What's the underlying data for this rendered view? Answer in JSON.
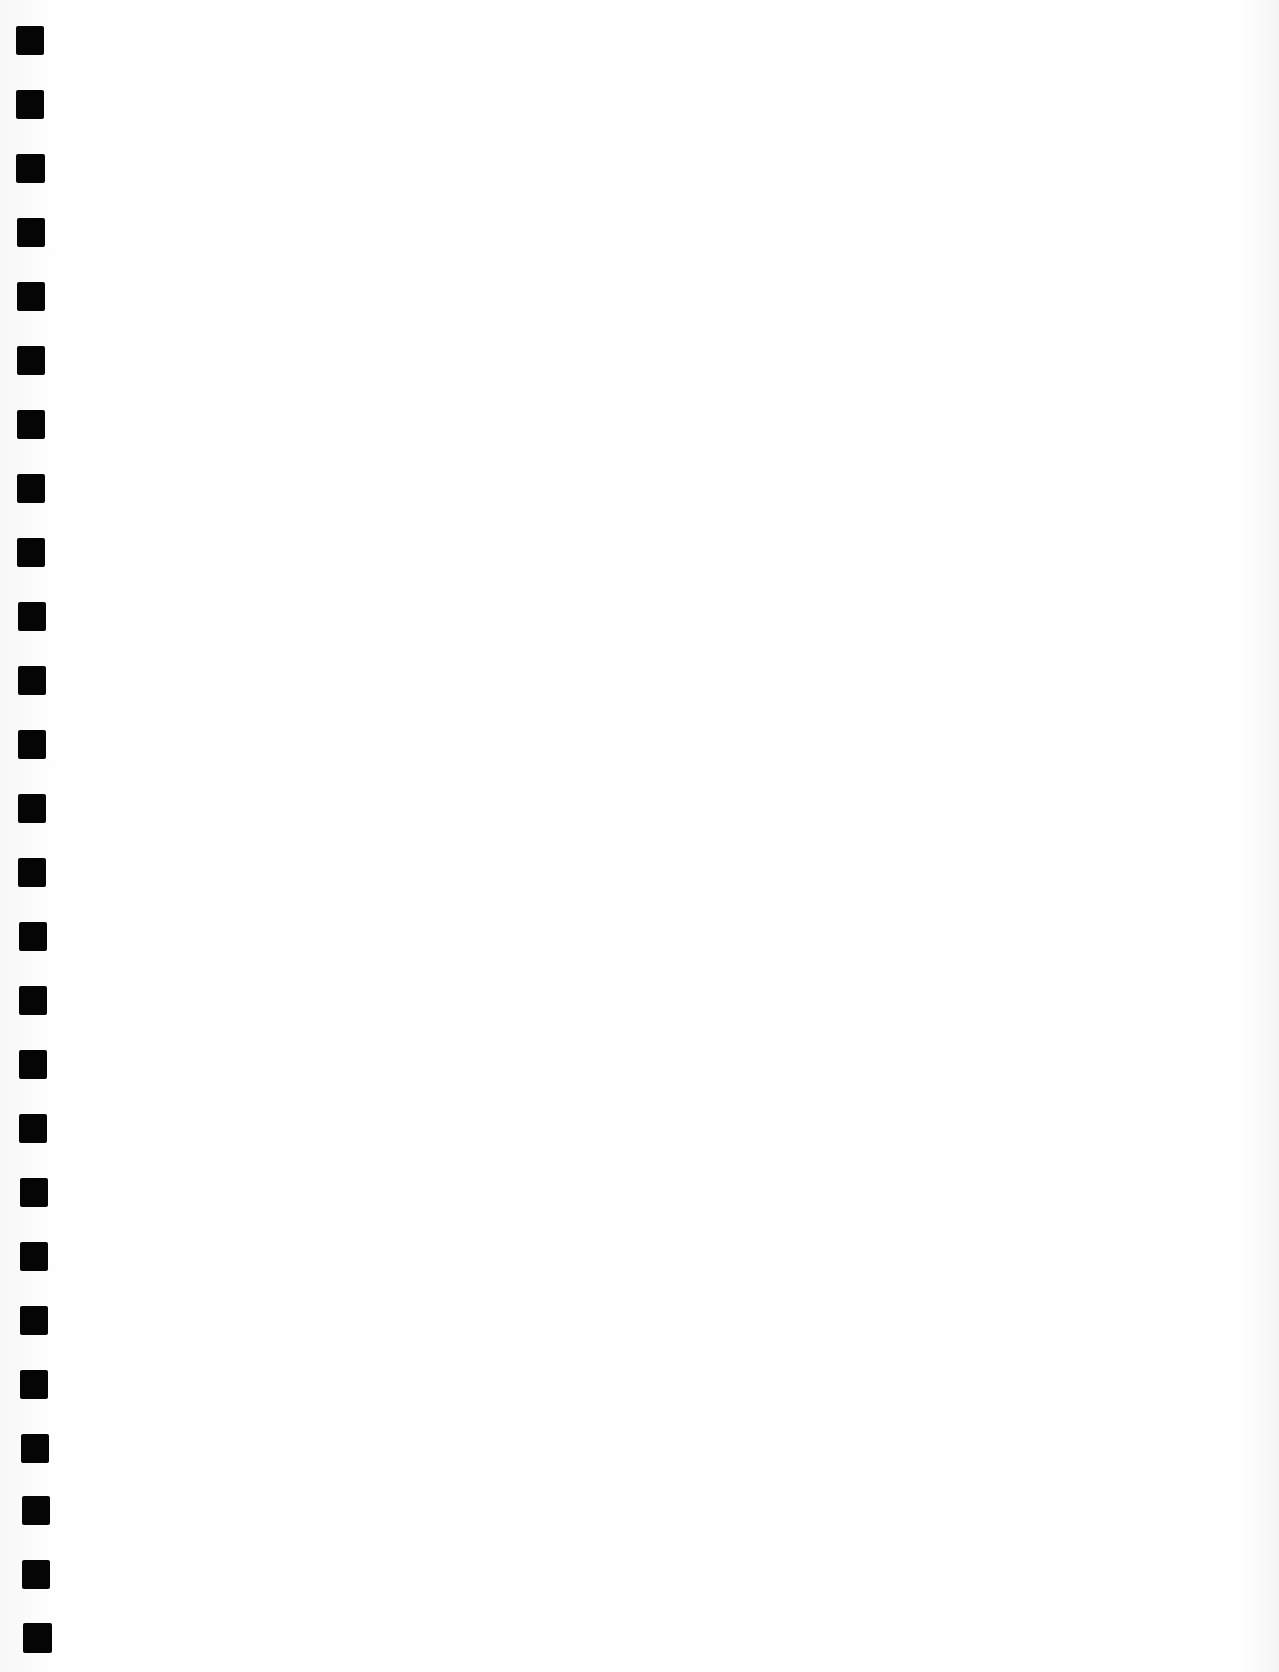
{
  "page": {
    "type": "blank-scanned-sheet",
    "background": "#ffffff",
    "binding": {
      "side": "left",
      "hole_count": 26,
      "hole_color": "#050505",
      "holes": [
        {
          "x": 16,
          "y": 26,
          "w": 28,
          "h": 29
        },
        {
          "x": 16,
          "y": 90,
          "w": 28,
          "h": 29
        },
        {
          "x": 16,
          "y": 154,
          "w": 29,
          "h": 29
        },
        {
          "x": 17,
          "y": 218,
          "w": 28,
          "h": 29
        },
        {
          "x": 17,
          "y": 282,
          "w": 28,
          "h": 29
        },
        {
          "x": 17,
          "y": 346,
          "w": 28,
          "h": 29
        },
        {
          "x": 17,
          "y": 410,
          "w": 28,
          "h": 29
        },
        {
          "x": 17,
          "y": 474,
          "w": 28,
          "h": 29
        },
        {
          "x": 17,
          "y": 538,
          "w": 28,
          "h": 29
        },
        {
          "x": 18,
          "y": 602,
          "w": 28,
          "h": 29
        },
        {
          "x": 18,
          "y": 666,
          "w": 28,
          "h": 29
        },
        {
          "x": 18,
          "y": 730,
          "w": 28,
          "h": 29
        },
        {
          "x": 18,
          "y": 794,
          "w": 28,
          "h": 29
        },
        {
          "x": 18,
          "y": 858,
          "w": 28,
          "h": 29
        },
        {
          "x": 19,
          "y": 922,
          "w": 28,
          "h": 29
        },
        {
          "x": 19,
          "y": 986,
          "w": 28,
          "h": 29
        },
        {
          "x": 19,
          "y": 1050,
          "w": 28,
          "h": 29
        },
        {
          "x": 19,
          "y": 1114,
          "w": 28,
          "h": 29
        },
        {
          "x": 20,
          "y": 1178,
          "w": 28,
          "h": 29
        },
        {
          "x": 20,
          "y": 1242,
          "w": 28,
          "h": 29
        },
        {
          "x": 20,
          "y": 1306,
          "w": 28,
          "h": 29
        },
        {
          "x": 20,
          "y": 1370,
          "w": 28,
          "h": 29
        },
        {
          "x": 21,
          "y": 1434,
          "w": 28,
          "h": 29
        },
        {
          "x": 22,
          "y": 1496,
          "w": 28,
          "h": 29
        },
        {
          "x": 22,
          "y": 1560,
          "w": 28,
          "h": 29
        },
        {
          "x": 23,
          "y": 1623,
          "w": 29,
          "h": 30
        }
      ]
    }
  }
}
